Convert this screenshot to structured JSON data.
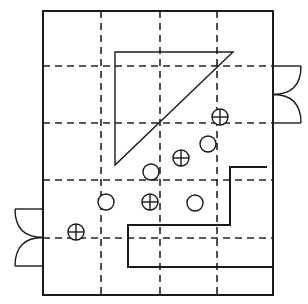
{
  "diagram": {
    "type": "floor-plan-grid",
    "colors": {
      "ink": "#1a1a1a",
      "background": "#ffffff"
    },
    "frame": {
      "x": 43,
      "y": 11,
      "width": 230,
      "height": 284
    },
    "grid": {
      "vertical_dashed_x": [
        101,
        160,
        217
      ],
      "horizontal_dashed_y": [
        66,
        123,
        180,
        238
      ]
    },
    "triangle": {
      "points": [
        [
          115,
          52
        ],
        [
          233,
          52
        ],
        [
          115,
          165
        ]
      ]
    },
    "stair_wall": {
      "points": [
        [
          267,
          167
        ],
        [
          230,
          167
        ],
        [
          230,
          225
        ],
        [
          128,
          225
        ],
        [
          128,
          267
        ],
        [
          273,
          267
        ]
      ]
    },
    "doors": [
      {
        "name": "right-door",
        "side": "right",
        "x": 273,
        "y_top": 66,
        "y_bottom": 123,
        "depth": 28
      },
      {
        "name": "left-door",
        "side": "left",
        "x": 43,
        "y_top": 209,
        "y_bottom": 266,
        "depth": 28
      }
    ],
    "crossed_circles": [
      {
        "cx": 220,
        "cy": 117,
        "r": 8
      },
      {
        "cx": 181,
        "cy": 158,
        "r": 8
      },
      {
        "cx": 150,
        "cy": 202,
        "r": 8
      },
      {
        "cx": 76,
        "cy": 232,
        "r": 8
      }
    ],
    "plain_circles": [
      {
        "cx": 208,
        "cy": 144,
        "r": 8
      },
      {
        "cx": 151,
        "cy": 172,
        "r": 8
      },
      {
        "cx": 106,
        "cy": 202,
        "r": 8
      },
      {
        "cx": 195,
        "cy": 203,
        "r": 8
      }
    ]
  }
}
